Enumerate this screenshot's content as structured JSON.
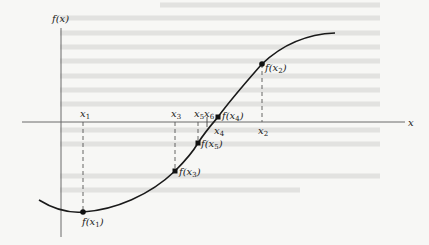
{
  "diagram": {
    "title": "",
    "axes": {
      "y_label": "f(x)",
      "x_label": "x"
    },
    "points": [
      {
        "name": "x1",
        "x_label": "x",
        "x_sub": "1",
        "f_label": "f(x",
        "f_sub": "1",
        "f_close": ")",
        "px": 83,
        "py": 212
      },
      {
        "name": "x2",
        "x_label": "x",
        "x_sub": "2",
        "f_label": "f(x",
        "f_sub": "2",
        "f_close": ")",
        "px": 262,
        "py": 64
      },
      {
        "name": "x3",
        "x_label": "x",
        "x_sub": "3",
        "f_label": "f(x",
        "f_sub": "3",
        "f_close": ")",
        "px": 175,
        "py": 171
      },
      {
        "name": "x4",
        "x_label": "x",
        "x_sub": "4",
        "f_label": "f(x",
        "f_sub": "4",
        "f_close": ")",
        "px": 218,
        "py": 117
      },
      {
        "name": "x5",
        "x_label": "x",
        "x_sub": "5",
        "f_label": "f(x",
        "f_sub": "5",
        "f_close": ")",
        "px": 198,
        "py": 143
      },
      {
        "name": "x6",
        "x_label": "x",
        "x_sub": "6"
      }
    ],
    "colors": {
      "curve": "#1a1a1a",
      "axis": "#6b6b6b",
      "background": "#f7f7f5"
    }
  }
}
